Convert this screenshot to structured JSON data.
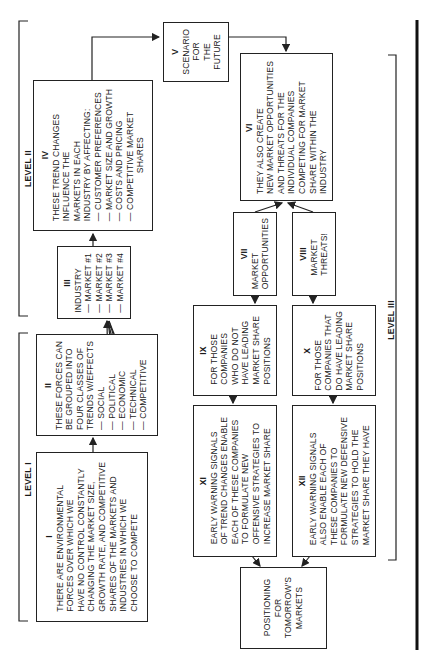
{
  "levels": {
    "level_1": "LEVEL I",
    "level_2": "LEVEL II",
    "level_3": "LEVEL III"
  },
  "boxes": {
    "I": {
      "number": "I",
      "lines": [
        "THERE ARE ENVIRONMENTAL",
        "FORCES OVER WHICH WE",
        "HAVE NO CONTROL CONSTANTLY",
        "CHANGING THE MARKET SIZE,",
        "GROWTH RATE, AND COMPETITIVE",
        "SHARES OF THE MARKETS AND",
        "INDUSTRIES IN WHICH WE",
        "CHOOSE TO COMPETE"
      ]
    },
    "II": {
      "number": "II",
      "lines": [
        "THESE FORCES CAN",
        "BE GROUPED INTO",
        "FOUR CLASSES OF",
        "TRENDS W/EFFECTS"
      ],
      "items": [
        "— SOCIAL",
        "— POLITICAL",
        "— ECONOMIC",
        "— TECHNICAL",
        "— COMPETITIVE"
      ]
    },
    "III": {
      "number": "III",
      "title": "INDUSTRY",
      "items": [
        "— MARKET #1",
        "— MARKET #2",
        "— MARKET #3",
        "— MARKET #4"
      ]
    },
    "IV": {
      "number": "IV",
      "lines": [
        "THESE TREND CHANGES",
        "INFLUENCE THE",
        "MARKETS IN EACH",
        "INDUSTRY BY AFFECTING:"
      ],
      "items": [
        "— CUSTOMER PREFERENCES",
        "— MARKET SIZE AND GROWTH",
        "— COSTS AND PRICING",
        "— COMPETITIVE MARKET",
        "SHARES"
      ]
    },
    "V": {
      "number": "V",
      "lines": [
        "SCENARIO",
        "FOR",
        "THE",
        "FUTURE"
      ]
    },
    "VI": {
      "number": "VI",
      "lines": [
        "THEY ALSO CREATE",
        "NEW MARKET OPPORTUNITIES",
        "AND THREATS FOR THE",
        "INDIVIDUAL COMPANIES",
        "COMPETING FOR MARKET",
        "SHARE WITHIN THE",
        "INDUSTRY"
      ]
    },
    "VII": {
      "number": "VII",
      "lines": [
        "MARKET",
        "OPPORTUNITIES"
      ]
    },
    "VIII": {
      "number": "VIII",
      "lines": [
        "MARKET",
        "THREATS!"
      ]
    },
    "IX": {
      "number": "IX",
      "lines": [
        "FOR THOSE",
        "COMPANIES",
        "WHO DO NOT",
        "HAVE LEADING",
        "MARKET SHARE",
        "POSITIONS"
      ]
    },
    "X": {
      "number": "X",
      "lines": [
        "FOR THOSE",
        "COMPANIES THAT",
        "DO HAVE LEADING",
        "MARKET SHARE",
        "POSITIONS"
      ]
    },
    "XI": {
      "number": "XI",
      "lines": [
        "EARLY WARNING SIGNALS",
        "OF TREND CHANGES ENABLE",
        "EACH OF THESE COMPANIES",
        "TO FORMULATE NEW",
        "OFFENSIVE STRATEGIES TO",
        "INCREASE MARKET SHARE"
      ]
    },
    "XII": {
      "number": "XII",
      "lines": [
        "EARLY WARNING SIGNALS",
        "ALSO ENABLE EACH OF",
        "THESE COMPANIES TO",
        "FORMULATE NEW DEFENSIVE",
        "STRATEGIES TO HOLD THE",
        "MARKET SHARE THEY HAVE"
      ]
    },
    "final": {
      "lines": [
        "POSITIONING",
        "FOR",
        "TOMORROW'S",
        "MARKETS"
      ]
    }
  },
  "colors": {
    "ink": "#222222",
    "background": "#ffffff"
  }
}
